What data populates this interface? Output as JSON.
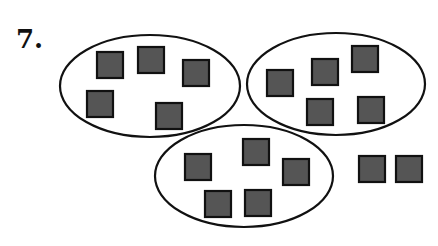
{
  "problem": {
    "number_label": "7.",
    "colors": {
      "square_fill": "#555555",
      "square_stroke": "#111111",
      "ellipse_stroke": "#111111"
    },
    "groups": [
      {
        "name": "group-1",
        "count": 5,
        "ellipse": {
          "cx": 150,
          "cy": 86,
          "rx": 90,
          "ry": 51
        },
        "squares": [
          [
            97,
            52
          ],
          [
            138,
            47
          ],
          [
            183,
            60
          ],
          [
            87,
            91
          ],
          [
            156,
            103
          ]
        ]
      },
      {
        "name": "group-2",
        "count": 5,
        "ellipse": {
          "cx": 336,
          "cy": 84,
          "rx": 89,
          "ry": 51
        },
        "squares": [
          [
            267,
            70
          ],
          [
            312,
            59
          ],
          [
            352,
            46
          ],
          [
            307,
            99
          ],
          [
            358,
            97
          ]
        ]
      },
      {
        "name": "group-3",
        "count": 5,
        "ellipse": {
          "cx": 244,
          "cy": 176,
          "rx": 89,
          "ry": 51
        },
        "squares": [
          [
            185,
            154
          ],
          [
            243,
            139
          ],
          [
            283,
            159
          ],
          [
            205,
            191
          ],
          [
            245,
            190
          ]
        ]
      }
    ],
    "leftover": {
      "count": 2,
      "squares": [
        [
          359,
          156
        ],
        [
          396,
          156
        ]
      ]
    },
    "square_size": 26
  }
}
